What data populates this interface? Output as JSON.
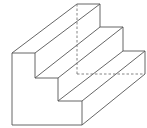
{
  "diagram": {
    "type": "isometric-line-drawing",
    "colors": {
      "stroke": "#555555",
      "background": "#ffffff",
      "hidden_line": "#777777"
    },
    "front_face": [
      [
        12,
        53
      ],
      [
        35,
        53
      ],
      [
        35,
        78
      ],
      [
        58,
        78
      ],
      [
        58,
        101
      ],
      [
        82,
        101
      ],
      [
        82,
        125
      ],
      [
        12,
        125
      ]
    ],
    "back_profile": [
      [
        77,
        4
      ],
      [
        100,
        4
      ],
      [
        100,
        27
      ],
      [
        123,
        27
      ],
      [
        123,
        51
      ],
      [
        145,
        51
      ],
      [
        145,
        74
      ]
    ],
    "depth_edges": [
      [
        [
          12,
          53
        ],
        [
          77,
          4
        ]
      ],
      [
        [
          35,
          53
        ],
        [
          100,
          4
        ]
      ],
      [
        [
          35,
          78
        ],
        [
          100,
          27
        ]
      ],
      [
        [
          58,
          78
        ],
        [
          123,
          27
        ]
      ],
      [
        [
          58,
          101
        ],
        [
          123,
          51
        ]
      ],
      [
        [
          82,
          101
        ],
        [
          145,
          51
        ]
      ],
      [
        [
          82,
          125
        ],
        [
          145,
          74
        ]
      ]
    ],
    "hidden_edges": [
      [
        [
          77,
          4
        ],
        [
          77,
          74
        ]
      ],
      [
        [
          77,
          74
        ],
        [
          145,
          74
        ]
      ]
    ]
  }
}
